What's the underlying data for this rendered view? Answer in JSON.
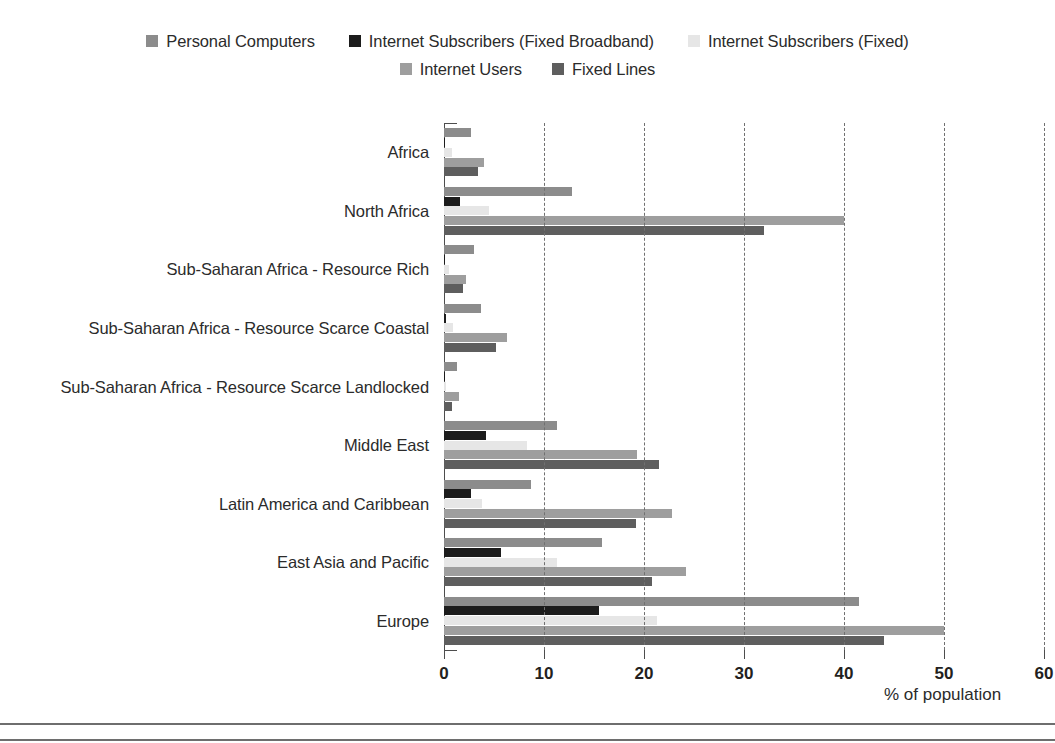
{
  "legend": {
    "rows": [
      [
        {
          "label": "Personal Computers",
          "color": "#8c8c8c"
        },
        {
          "label": "Internet Subscribers (Fixed Broadband)",
          "color": "#1c1c1c"
        },
        {
          "label": "Internet Subscribers (Fixed)",
          "color": "#e6e6e6"
        }
      ],
      [
        {
          "label": "Internet Users",
          "color": "#9e9e9e"
        },
        {
          "label": "Fixed Lines",
          "color": "#5e5e5e"
        }
      ]
    ]
  },
  "chart_data": {
    "type": "bar",
    "orientation": "horizontal",
    "title": "",
    "xlabel": "% of population",
    "ylabel": "",
    "xlim": [
      0,
      60
    ],
    "xticks": [
      0,
      10,
      20,
      30,
      40,
      50,
      60
    ],
    "grid": "vertical-dashed",
    "legend_position": "top-center",
    "categories": [
      "Africa",
      "North Africa",
      "Sub-Saharan Africa - Resource Rich",
      "Sub-Saharan Africa - Resource Scarce Coastal",
      "Sub-Saharan Africa - Resource Scarce Landlocked",
      "Middle East",
      "Latin America and Caribbean",
      "East Asia and Pacific",
      "Europe"
    ],
    "series": [
      {
        "name": "Personal Computers",
        "color": "#8c8c8c",
        "values": [
          2.7,
          12.8,
          3.0,
          3.7,
          1.3,
          11.3,
          8.7,
          15.8,
          41.5
        ]
      },
      {
        "name": "Internet Subscribers (Fixed Broadband)",
        "color": "#1c1c1c",
        "values": [
          0.1,
          1.6,
          0.05,
          0.15,
          0.02,
          4.2,
          2.7,
          5.7,
          15.5
        ]
      },
      {
        "name": "Internet Subscribers (Fixed)",
        "color": "#e6e6e6",
        "values": [
          0.8,
          4.5,
          0.5,
          0.9,
          0.15,
          8.3,
          3.8,
          11.3,
          21.3
        ]
      },
      {
        "name": "Internet Users",
        "color": "#9e9e9e",
        "values": [
          4.0,
          40.0,
          2.2,
          6.3,
          1.5,
          19.3,
          22.8,
          24.2,
          50.0
        ]
      },
      {
        "name": "Fixed Lines",
        "color": "#5e5e5e",
        "values": [
          3.4,
          32.0,
          1.9,
          5.2,
          0.8,
          21.5,
          19.2,
          20.8,
          44.0
        ]
      }
    ]
  }
}
